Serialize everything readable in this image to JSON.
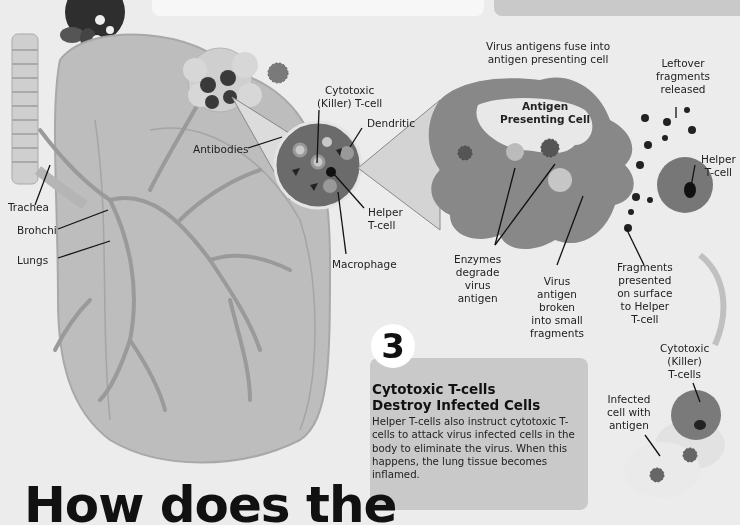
{
  "top_boxes": {
    "left_text": "",
    "right_text": ""
  },
  "left_diagram": {
    "labels": {
      "trachea": "Trachea",
      "bronchi": "Brohchi",
      "lungs": "Lungs",
      "antibodies": "Antibodies",
      "cytotoxic_killer_tcell": [
        "Cytotoxic",
        "(Killer) T-cell"
      ],
      "dendritic": "Dendritic",
      "helper_tcell": [
        "Helper",
        "T-cell"
      ],
      "macrophage": "Macrophage"
    }
  },
  "right_diagram": {
    "apc_title": [
      "Antigen",
      "Presenting Cell"
    ],
    "labels": {
      "virus_fuse": [
        "Virus antigens fuse into",
        "antigen presenting cell"
      ],
      "leftover": [
        "Leftover",
        "fragments",
        "released"
      ],
      "helper_tcell": [
        "Helper",
        "T-cell"
      ],
      "enzymes": [
        "Enzymes",
        "degrade",
        "virus",
        "antigen"
      ],
      "virus_broken": [
        "Virus",
        "antigen",
        "broken",
        "into small",
        "fragments"
      ],
      "fragments_presented": [
        "Fragments",
        "presented",
        "on surface",
        "to Helper",
        "T-cell"
      ],
      "cytotoxic_tcells": [
        "Cytotoxic",
        "(Killer)",
        "T-cells"
      ],
      "infected_cell": [
        "Infected",
        "cell with",
        "antigen"
      ]
    }
  },
  "step3": {
    "number": "3",
    "title_line1": "Cytotoxic T-cells",
    "title_line2": "Destroy Infected Cells",
    "body": "Helper T-cells also instruct cytotoxic T-cells to attack virus infected cells in the body to eliminate the virus. When this happens, the lung tissue becomes inflamed."
  },
  "headline": "How does the",
  "colors": {
    "background": "#ececec",
    "lung": "#bdbdbd",
    "cell_dark": "#6e6e6e",
    "card": "#c9c9c9",
    "text": "#111111"
  }
}
